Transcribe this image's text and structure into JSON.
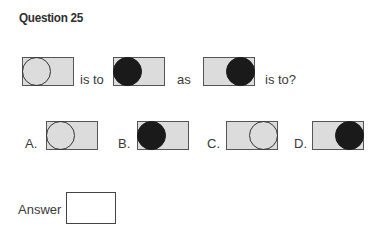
{
  "question": {
    "title": "Question 25",
    "connector_is_to": "is to",
    "connector_as": "as",
    "connector_is_to_q": "is to?"
  },
  "stem_figures": [
    {
      "circle_position": "left",
      "circle_fill": "none"
    },
    {
      "circle_position": "left",
      "circle_fill": "black"
    },
    {
      "circle_position": "right",
      "circle_fill": "black"
    }
  ],
  "options": [
    {
      "label": "A.",
      "circle_position": "left",
      "circle_fill": "none"
    },
    {
      "label": "B.",
      "circle_position": "left",
      "circle_fill": "black"
    },
    {
      "label": "C.",
      "circle_position": "right",
      "circle_fill": "none"
    },
    {
      "label": "D.",
      "circle_position": "right",
      "circle_fill": "black"
    }
  ],
  "answer": {
    "label": "Answer",
    "value": ""
  },
  "colors": {
    "box_fill": "#dcdcdc",
    "box_border": "#555555",
    "circle_black": "#1a1a1a",
    "circle_outline": "#333333"
  }
}
